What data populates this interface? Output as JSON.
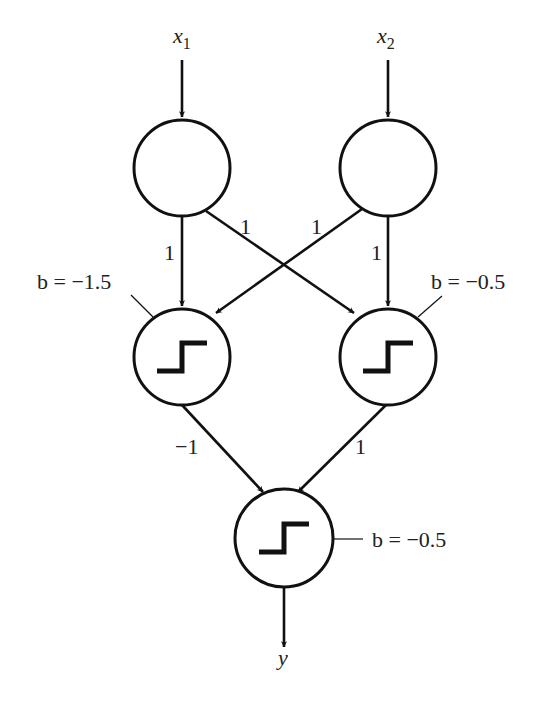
{
  "diagram": {
    "type": "neural-network (XOR perceptron)",
    "colors": {
      "stroke": "#111111",
      "text": "#222222",
      "background": "#ffffff"
    },
    "inputs": [
      {
        "id": "x1",
        "label": "x",
        "subscript": "1"
      },
      {
        "id": "x2",
        "label": "x",
        "subscript": "2"
      }
    ],
    "hidden": [
      {
        "id": "h1",
        "bias_label": "b = −1.5",
        "activation": "step"
      },
      {
        "id": "h2",
        "bias_label": "b = −0.5",
        "activation": "step"
      }
    ],
    "output": {
      "id": "y",
      "label": "y",
      "bias_label": "b = −0.5",
      "activation": "step"
    },
    "weights": {
      "x1_h1": "1",
      "x1_h2": "1",
      "x2_h1": "1",
      "x2_h2": "1",
      "h1_y": "−1",
      "h2_y": "1"
    },
    "edges": [
      {
        "from": "x1",
        "to": "h1",
        "weight": "1"
      },
      {
        "from": "x1",
        "to": "h2",
        "weight": "1"
      },
      {
        "from": "x2",
        "to": "h1",
        "weight": "1"
      },
      {
        "from": "x2",
        "to": "h2",
        "weight": "1"
      },
      {
        "from": "h1",
        "to": "y",
        "weight": "−1"
      },
      {
        "from": "h2",
        "to": "y",
        "weight": "1"
      }
    ]
  }
}
